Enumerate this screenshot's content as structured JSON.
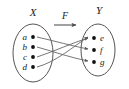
{
  "figure": {
    "type": "function-mapping-diagram",
    "domain_label": "X",
    "codomain_label": "Y",
    "function_label": "F",
    "domain_elements": [
      "a",
      "b",
      "c",
      "d"
    ],
    "codomain_elements": [
      "e",
      "f",
      "g"
    ],
    "mappings": [
      {
        "from": "a",
        "to": "f"
      },
      {
        "from": "b",
        "to": "g"
      },
      {
        "from": "c",
        "to": "e"
      },
      {
        "from": "d",
        "to": "e"
      }
    ],
    "colors": {
      "ink": "#1a1a1a",
      "stroke": "#555555",
      "arrow": "#666666",
      "background": "#ffffff"
    }
  }
}
